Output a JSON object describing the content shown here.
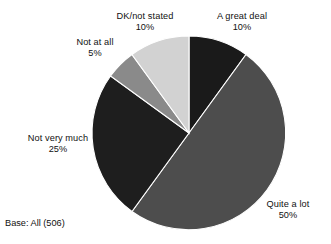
{
  "chart_data": {
    "type": "pie",
    "title": "",
    "subtitle": "",
    "xlabel": "",
    "ylabel": "",
    "legend_position": "none",
    "grid": false,
    "start_angle_deg": 0,
    "direction": "clockwise",
    "center": {
      "x": 189,
      "y": 133
    },
    "radius": 97,
    "base_note": "Base: All (506)",
    "categories": [
      "A great deal",
      "Quite a lot",
      "Not very much",
      "Not at all",
      "DK/not stated"
    ],
    "values": [
      10,
      50,
      25,
      5,
      10
    ],
    "value_labels": [
      "10%",
      "50%",
      "25%",
      "5%",
      "10%"
    ],
    "colors": [
      "#1a1a1a",
      "#4d4d4d",
      "#1e1e1e",
      "#8a8a8a",
      "#d2d2d2"
    ],
    "slices": [
      {
        "label": "A great deal",
        "value": 10,
        "value_label": "10%",
        "color": "#1a1a1a",
        "start_deg": 0,
        "end_deg": 36
      },
      {
        "label": "Quite a lot",
        "value": 50,
        "value_label": "50%",
        "color": "#4d4d4d",
        "start_deg": 36,
        "end_deg": 216
      },
      {
        "label": "Not very much",
        "value": 25,
        "value_label": "25%",
        "color": "#1e1e1e",
        "start_deg": 216,
        "end_deg": 306
      },
      {
        "label": "Not at all",
        "value": 5,
        "value_label": "5%",
        "color": "#8a8a8a",
        "start_deg": 306,
        "end_deg": 324
      },
      {
        "label": "DK/not stated",
        "value": 10,
        "value_label": "10%",
        "color": "#d2d2d2",
        "start_deg": 324,
        "end_deg": 360
      }
    ]
  },
  "labels": {
    "dk": {
      "name": "DK/not stated",
      "value": "10%"
    },
    "great_deal": {
      "name": "A great deal",
      "value": "10%"
    },
    "not_at_all": {
      "name": "Not at all",
      "value": "5%"
    },
    "not_very_much": {
      "name": "Not very much",
      "value": "25%"
    },
    "quite_a_lot": {
      "name": "Quite a lot",
      "value": "50%"
    }
  },
  "footnote": "Base: All (506)"
}
